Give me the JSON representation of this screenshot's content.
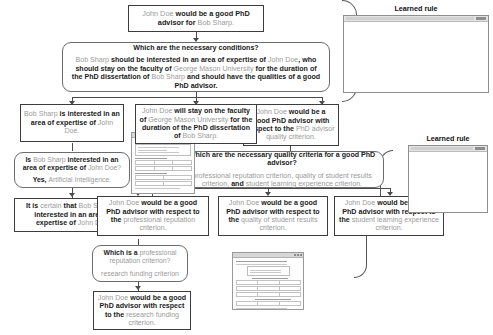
{
  "figure": {
    "type": "problem-reduction-tree",
    "palette": {
      "entity_text": "#9a9a9a",
      "relation_text": "#1a1a1a",
      "node_border": "#3d3d3d",
      "qa_border": "#6b6b6b",
      "connector": "#4a4a4a",
      "background": "#ffffff"
    }
  },
  "nodes": {
    "root": {
      "kind": "hypothesis",
      "text": "John Doe would be a good PhD advisor for Bob Sharp.",
      "segments": [
        {
          "t": "John Doe",
          "s": "entity"
        },
        {
          "t": " would be a good PhD advisor for ",
          "s": "relation"
        },
        {
          "t": "Bob Sharp.",
          "s": "entity"
        }
      ]
    },
    "q_necessary_conditions": {
      "kind": "question-answer",
      "question": "Which are the necessary conditions?",
      "answer": "Bob Sharp should be interested in an area of expertise of John Doe, who should stay on the faculty of George Mason University for the duration of the PhD dissertation of Bob Sharp and should have the qualities of a good PhD advisor.",
      "answer_segments": [
        {
          "t": "Bob Sharp",
          "s": "entity"
        },
        {
          "t": " should be interested in an area of expertise of ",
          "s": "relation"
        },
        {
          "t": "John Doe",
          "s": "entity"
        },
        {
          "t": ", who should stay on the faculty of ",
          "s": "relation"
        },
        {
          "t": "George Mason University",
          "s": "entity"
        },
        {
          "t": " for the duration of the PhD dissertation of ",
          "s": "relation"
        },
        {
          "t": "Bob Sharp",
          "s": "entity"
        },
        {
          "t": " and should have the qualities of a good PhD advisor.",
          "s": "relation"
        }
      ]
    },
    "sub_interest": {
      "kind": "hypothesis",
      "text": "Bob Sharp is interested in an area of expertise of John Doe.",
      "segments": [
        {
          "t": "Bob Sharp",
          "s": "entity"
        },
        {
          "t": " is interested in an area of expertise of ",
          "s": "relation"
        },
        {
          "t": "John Doe.",
          "s": "entity"
        }
      ]
    },
    "q_interest": {
      "kind": "question-answer",
      "question": "Is Bob Sharp interested in an area of expertise of John Doe?",
      "question_segments": [
        {
          "t": "Is ",
          "s": "relation"
        },
        {
          "t": "Bob Sharp",
          "s": "entity"
        },
        {
          "t": " interested in an area of expertise of ",
          "s": "relation"
        },
        {
          "t": "John Doe?",
          "s": "entity"
        }
      ],
      "answer": "Yes, Artificial Intelligence.",
      "answer_segments": [
        {
          "t": "Yes, ",
          "s": "relation"
        },
        {
          "t": "Artificial Intelligence.",
          "s": "entity"
        }
      ]
    },
    "concl_interest": {
      "kind": "hypothesis",
      "text": "It is certain that Bob Sharp is interested in an area of expertise of John Doe.",
      "segments": [
        {
          "t": "It is ",
          "s": "relation"
        },
        {
          "t": "certain",
          "s": "entity"
        },
        {
          "t": " that ",
          "s": "relation"
        },
        {
          "t": "Bob Sharp",
          "s": "entity"
        },
        {
          "t": " is interested in an area of expertise of ",
          "s": "relation"
        },
        {
          "t": "John Doe.",
          "s": "entity"
        }
      ]
    },
    "sub_faculty": {
      "kind": "hypothesis",
      "text": "John Doe will stay on the faculty of George Mason University for the duration of the PhD dissertation of Bob Sharp.",
      "segments": [
        {
          "t": "John Doe",
          "s": "entity"
        },
        {
          "t": " will stay on the faculty of ",
          "s": "relation"
        },
        {
          "t": "George Mason University",
          "s": "entity"
        },
        {
          "t": " for the duration of the PhD dissertation of ",
          "s": "relation"
        },
        {
          "t": "Bob Sharp.",
          "s": "entity"
        }
      ]
    },
    "sub_quality": {
      "kind": "hypothesis",
      "text": "John Doe would be a good PhD advisor with respect to the PhD advisor quality criterion.",
      "segments": [
        {
          "t": "John Doe",
          "s": "entity"
        },
        {
          "t": " would be a good PhD advisor with respect to the ",
          "s": "relation"
        },
        {
          "t": "PhD advisor quality criterion.",
          "s": "entity"
        }
      ]
    },
    "q_quality_criteria": {
      "kind": "question-answer",
      "question": "Which are the necessary quality criteria for a good PhD advisor?",
      "answer": "professional reputation criterion, quality of student results criterion, and student learning experience criterion.",
      "answer_segments": [
        {
          "t": "professional reputation criterion, quality of student results criterion,",
          "s": "entity"
        },
        {
          "t": " and ",
          "s": "relation"
        },
        {
          "t": "student learning experience criterion.",
          "s": "entity"
        }
      ]
    },
    "leaf_reputation": {
      "kind": "hypothesis",
      "text": "John Doe would be a good PhD advisor with respect to the professional reputation criterion.",
      "segments": [
        {
          "t": "John Doe",
          "s": "entity"
        },
        {
          "t": " would be a good PhD advisor with respect to the ",
          "s": "relation"
        },
        {
          "t": "professional reputation criterion.",
          "s": "entity"
        }
      ]
    },
    "leaf_results": {
      "kind": "hypothesis",
      "text": "John Doe would be a good PhD advisor with respect to the quality of student results criterion.",
      "segments": [
        {
          "t": "John Doe",
          "s": "entity"
        },
        {
          "t": " would be a good PhD advisor with respect to the ",
          "s": "relation"
        },
        {
          "t": "quality of student results criterion.",
          "s": "entity"
        }
      ]
    },
    "leaf_learning": {
      "kind": "hypothesis",
      "text": "John Doe would be a good PhD advisor with respect to the student learning experience criterion.",
      "segments": [
        {
          "t": "John Doe",
          "s": "entity"
        },
        {
          "t": " would be a good PhD advisor with respect to the ",
          "s": "relation"
        },
        {
          "t": "student learning experience criterion.",
          "s": "entity"
        }
      ]
    },
    "q_reputation": {
      "kind": "question-answer",
      "question": "Which is a professional reputation criterion?",
      "question_segments": [
        {
          "t": "Which is a ",
          "s": "relation"
        },
        {
          "t": "professional reputation criterion?",
          "s": "entity"
        }
      ],
      "answer": "research funding criterion",
      "answer_segments": [
        {
          "t": "research funding criterion",
          "s": "entity"
        }
      ]
    },
    "leaf_funding": {
      "kind": "hypothesis",
      "text": "John Doe would be a good PhD advisor with respect to the research funding criterion.",
      "segments": [
        {
          "t": "John Doe",
          "s": "entity"
        },
        {
          "t": " would be a good PhD advisor with respect to the ",
          "s": "relation"
        },
        {
          "t": "research funding criterion.",
          "s": "entity"
        }
      ]
    }
  },
  "panels": [
    {
      "id": "learned-rule-top",
      "title": "Learned rule"
    },
    {
      "id": "learned-rule-right",
      "title": "Learned rule"
    }
  ],
  "thumbnails": [
    {
      "id": "thumb-rule-editor-left",
      "label": "rule editor screenshot"
    },
    {
      "id": "thumb-rule-editor-lower",
      "label": "rule editor screenshot"
    }
  ]
}
